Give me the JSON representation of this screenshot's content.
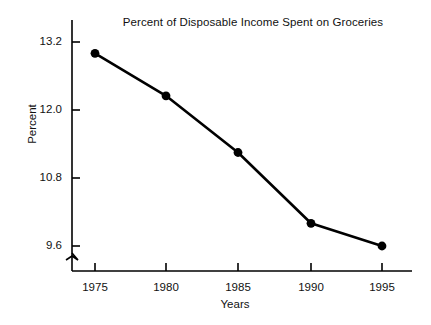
{
  "chart_data": {
    "type": "line",
    "title": "Percent of Disposable Income Spent on Groceries",
    "xlabel": "Years",
    "ylabel": "Percent",
    "categories": [
      "1975",
      "1980",
      "1985",
      "1990",
      "1995"
    ],
    "x": [
      1975,
      1980,
      1985,
      1990,
      1995
    ],
    "values": [
      13.0,
      12.25,
      11.25,
      10.0,
      9.6
    ],
    "series": [
      {
        "name": "Percent of disposable income spent on groceries",
        "values": [
          13.0,
          12.25,
          11.25,
          10.0,
          9.6
        ]
      }
    ],
    "y_ticks": [
      "13.2",
      "12.0",
      "10.8",
      "9.6"
    ],
    "y_tick_values": [
      13.2,
      12.0,
      10.8,
      9.6
    ],
    "x_ticks": [
      "1975",
      "1980",
      "1985",
      "1990",
      "1995"
    ],
    "ylim": [
      9.6,
      13.2
    ],
    "xlim": [
      1975,
      1995
    ],
    "grid": false,
    "legend": false,
    "legend_position": "none",
    "y_axis_break": true,
    "marker": "filled-circle",
    "line_color": "#000000",
    "marker_color": "#000000",
    "axis_color": "#000000",
    "background_color": "#ffffff"
  },
  "labels": {
    "title": "Percent of Disposable Income Spent on Groceries",
    "y_axis": "Percent",
    "x_axis": "Years",
    "y1": "13.2",
    "y2": "12.0",
    "y3": "10.8",
    "y4": "9.6",
    "x1": "1975",
    "x2": "1980",
    "x3": "1985",
    "x4": "1990",
    "x5": "1995"
  }
}
